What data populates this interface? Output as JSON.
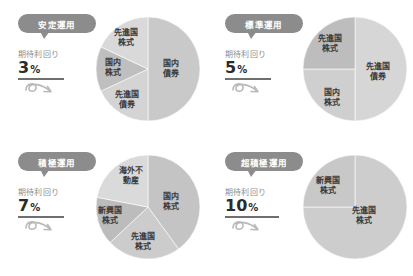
{
  "chart_data": [
    {
      "type": "pie",
      "title": "安定運用",
      "yield_label": "期待利回り",
      "yield_value": "3",
      "yield_unit": "%",
      "categories": [
        "国内債券",
        "先進国株式",
        "国内株式",
        "先進国債券"
      ],
      "values": [
        50,
        18,
        14,
        18
      ],
      "colors": [
        "#c9c9c9",
        "#d4d4d4",
        "#bfbfbf",
        "#d9d9d9"
      ],
      "label_positions": [
        {
          "x": 76,
          "y": 53
        },
        {
          "x": 31,
          "y": 22
        },
        {
          "x": 18,
          "y": 52
        },
        {
          "x": 32,
          "y": 84
        }
      ]
    },
    {
      "type": "pie",
      "title": "標準運用",
      "yield_label": "期待利回り",
      "yield_value": "5",
      "yield_unit": "%",
      "categories": [
        "先進国債券",
        "先進国株式",
        "国内株式"
      ],
      "values": [
        50,
        25,
        25
      ],
      "colors": [
        "#d6d6d6",
        "#cfcfcf",
        "#bdbdbd"
      ],
      "label_positions": [
        {
          "x": 76,
          "y": 56
        },
        {
          "x": 28,
          "y": 28
        },
        {
          "x": 30,
          "y": 82
        }
      ]
    },
    {
      "type": "pie",
      "title": "積極運用",
      "yield_label": "期待利回り",
      "yield_value": "7",
      "yield_unit": "%",
      "categories": [
        "国内株式",
        "先進国株式",
        "新興国株式",
        "海外不動産"
      ],
      "values": [
        40,
        23,
        15,
        22
      ],
      "colors": [
        "#c4c4c4",
        "#cccccc",
        "#bcbcbc",
        "#dadada"
      ],
      "label_positions": [
        {
          "x": 76,
          "y": 48
        },
        {
          "x": 48,
          "y": 88
        },
        {
          "x": 15,
          "y": 62
        },
        {
          "x": 36,
          "y": 22
        }
      ]
    },
    {
      "type": "pie",
      "title": "超積極運用",
      "yield_label": "期待利回り",
      "yield_value": "10",
      "yield_unit": "%",
      "categories": [
        "先進国株式",
        "新興国株式"
      ],
      "values": [
        75,
        25
      ],
      "colors": [
        "#cdcdcd",
        "#c8c8c8"
      ],
      "label_positions": [
        {
          "x": 62,
          "y": 62
        },
        {
          "x": 26,
          "y": 32
        }
      ]
    }
  ],
  "theme": {
    "pill_bg": "#8c8c8c",
    "pill_text": "#ffffff",
    "value_text": "#2b2b2b",
    "label_text": "#8e8e8e",
    "slice_text": "#3a3a3a",
    "background": "#ffffff"
  },
  "icons": {
    "arrow": "curly-arrow-icon"
  }
}
